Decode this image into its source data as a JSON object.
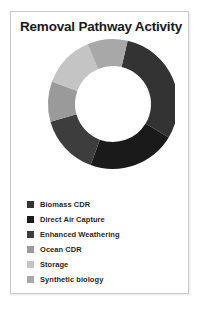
{
  "card": {
    "title": "Removal Pathway Activity"
  },
  "legend": {
    "items": [
      {
        "label": "Biomass CDR",
        "color": "#333333",
        "swatch_icon": "square-swatch-icon"
      },
      {
        "label": "Direct Air Capture",
        "color": "#1a1a1a",
        "swatch_icon": "square-swatch-icon"
      },
      {
        "label": "Enhanced Weathering",
        "color": "#3d3d3d",
        "swatch_icon": "square-swatch-icon"
      },
      {
        "label": "Ocean CDR",
        "color": "#9a9a9a",
        "swatch_icon": "square-swatch-icon"
      },
      {
        "label": "Storage",
        "color": "#c4c4c4",
        "swatch_icon": "square-swatch-icon"
      },
      {
        "label": "Synthetic biology",
        "color": "#a8a8a8",
        "swatch_icon": "square-swatch-icon"
      }
    ]
  },
  "chart_data": {
    "type": "pie",
    "title": "Removal Pathway Activity",
    "subtitle": "",
    "variant": "donut",
    "start_angle_deg": 13,
    "direction": "clockwise",
    "center": [
      88,
      70
    ],
    "outer_radius": 65,
    "inner_radius": 38,
    "legend_position": "bottom",
    "grid": false,
    "categories": [
      "Biomass CDR",
      "Direct Air Capture",
      "Enhanced Weathering",
      "Ocean CDR",
      "Storage",
      "Synthetic biology"
    ],
    "values": [
      30,
      22,
      15,
      10,
      13,
      10
    ],
    "colors": [
      "#333333",
      "#1a1a1a",
      "#3d3d3d",
      "#9a9a9a",
      "#c4c4c4",
      "#a8a8a8"
    ],
    "xlabel": "",
    "ylabel": ""
  }
}
